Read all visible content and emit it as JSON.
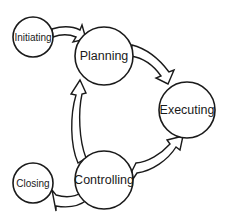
{
  "diagram": {
    "type": "process-cycle",
    "nodes": [
      {
        "id": "initiating",
        "label": "Initiating",
        "cx": 33,
        "cy": 37,
        "r": 20,
        "font_size": 10
      },
      {
        "id": "planning",
        "label": "Planning",
        "cx": 104,
        "cy": 56,
        "r": 29,
        "font_size": 12.5
      },
      {
        "id": "executing",
        "label": "Executing",
        "cx": 187,
        "cy": 110,
        "r": 28,
        "font_size": 12.5
      },
      {
        "id": "controlling",
        "label": "Controlling",
        "cx": 104,
        "cy": 180,
        "r": 29,
        "font_size": 12.5
      },
      {
        "id": "closing",
        "label": "Closing",
        "cx": 33,
        "cy": 183,
        "r": 20,
        "font_size": 10
      }
    ],
    "edges": [
      {
        "from": "initiating",
        "to": "planning",
        "style": "block-arrow"
      },
      {
        "from": "planning",
        "to": "executing",
        "style": "block-arrow"
      },
      {
        "from": "executing",
        "to": "controlling",
        "style": "double-block-arrow"
      },
      {
        "from": "controlling",
        "to": "planning",
        "style": "block-arrow"
      },
      {
        "from": "controlling",
        "to": "closing",
        "style": "block-arrow"
      }
    ],
    "colors": {
      "stroke": "#1a1a1a",
      "fill": "#ffffff",
      "background": "#ffffff"
    }
  }
}
